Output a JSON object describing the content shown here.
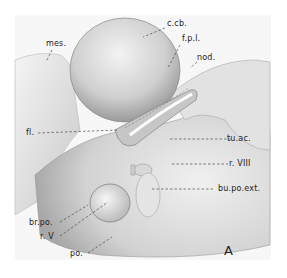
{
  "figure": {
    "panel_letter": "A",
    "labels": [
      {
        "id": "mes",
        "text": "mes."
      },
      {
        "id": "c-cb",
        "text": "c.cb."
      },
      {
        "id": "f-p-l",
        "text": "f.p.l."
      },
      {
        "id": "nod",
        "text": "nod."
      },
      {
        "id": "fl",
        "text": "fl."
      },
      {
        "id": "tu-ac",
        "text": "tu.ac."
      },
      {
        "id": "r-viii",
        "text": "r. VIII"
      },
      {
        "id": "bu-po-ext",
        "text": "bu.po.ext."
      },
      {
        "id": "br-po",
        "text": "br.po."
      },
      {
        "id": "r-v",
        "text": "r. V"
      },
      {
        "id": "po",
        "text": "po."
      }
    ]
  }
}
